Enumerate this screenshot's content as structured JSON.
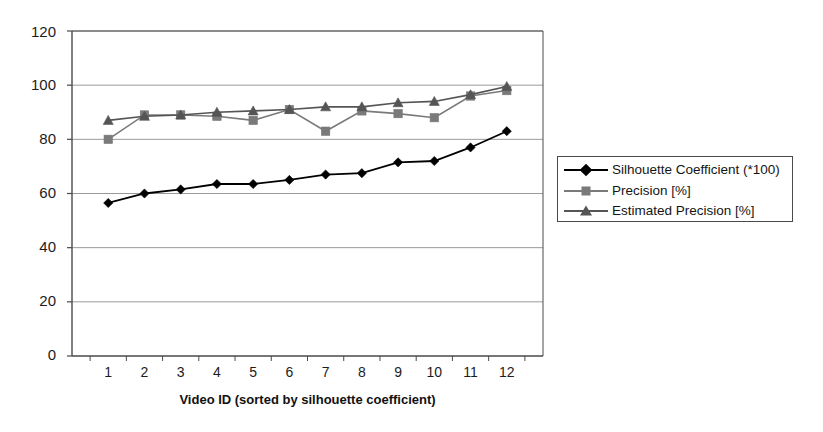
{
  "chart_data": {
    "type": "line",
    "title": "",
    "xlabel": "Video ID (sorted by silhouette coefficient)",
    "ylabel": "",
    "categories": [
      "1",
      "2",
      "3",
      "4",
      "5",
      "6",
      "7",
      "8",
      "9",
      "10",
      "11",
      "12"
    ],
    "x": [
      1,
      2,
      3,
      4,
      5,
      6,
      7,
      8,
      9,
      10,
      11,
      12
    ],
    "xlim": [
      0.5,
      12.5
    ],
    "ylim": [
      0,
      120
    ],
    "y_ticks": [
      0,
      20,
      40,
      60,
      80,
      100,
      120
    ],
    "y_tick_labels": [
      "0",
      "20",
      "40",
      "60",
      "80",
      "100",
      "120"
    ],
    "x_tick_labels": [
      "1",
      "2",
      "3",
      "4",
      "5",
      "6",
      "7",
      "8",
      "9",
      "10",
      "11",
      "12"
    ],
    "grid": "horizontal",
    "legend_position": "right",
    "series": [
      {
        "name": "Silhouette Coefficient (*100)",
        "marker": "diamond",
        "color": "#000000",
        "values": [
          56.5,
          60,
          61.5,
          63.5,
          63.5,
          65,
          67,
          67.5,
          71.5,
          72,
          77,
          83
        ]
      },
      {
        "name": "Precision [%]",
        "marker": "square",
        "color": "#7a7a7a",
        "values": [
          80,
          89,
          89,
          88.5,
          87,
          91,
          83,
          90.5,
          89.5,
          88,
          96,
          98
        ]
      },
      {
        "name": "Estimated Precision [%]",
        "marker": "triangle",
        "color": "#555555",
        "values": [
          87,
          88.5,
          89,
          90,
          90.5,
          91,
          92,
          92,
          93.5,
          94,
          96.5,
          99.5
        ]
      }
    ]
  },
  "legend": {
    "entries": [
      "Silhouette Coefficient (*100)",
      "Precision [%]",
      "Estimated Precision [%]"
    ]
  },
  "axes": {
    "x_title": "Video ID (sorted by silhouette coefficient)"
  },
  "colors": {
    "axis": "#4a4a4a",
    "grid": "#9a9a9a",
    "series_1": "#000000",
    "series_2": "#7a7a7a",
    "series_3": "#555555",
    "background": "#ffffff"
  }
}
